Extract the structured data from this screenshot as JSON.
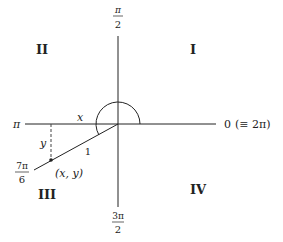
{
  "diagram": {
    "colors": {
      "stroke": "#222222",
      "background": "#ffffff"
    },
    "center": [
      118,
      124
    ],
    "arc_radius": 22,
    "axis_labels": {
      "right": {
        "main": "0",
        "equiv": "(≡ 2π)"
      },
      "top": {
        "num": "π",
        "den": "2"
      },
      "left": "π",
      "bottom": {
        "num": "3π",
        "den": "2"
      }
    },
    "angle_label": {
      "num": "7π",
      "den": "6"
    },
    "quadrants": {
      "q1": "I",
      "q2": "II",
      "q3": "III",
      "q4": "IV"
    },
    "segment_labels": {
      "x": "x",
      "y": "y",
      "radius": "1"
    },
    "point_label": "(x, y)"
  }
}
